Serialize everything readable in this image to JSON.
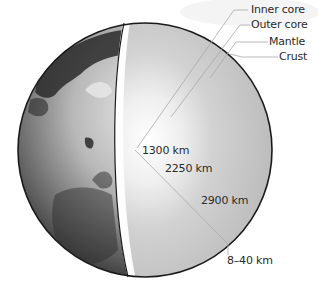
{
  "diagram": {
    "layers": [
      {
        "label": "Inner core"
      },
      {
        "label": "Outer core"
      },
      {
        "label": "Mantle"
      },
      {
        "label": "Crust"
      }
    ],
    "depths": [
      {
        "label": "1300 km"
      },
      {
        "label": "2250 km"
      },
      {
        "label": "2900 km"
      },
      {
        "label": "8–40 km"
      }
    ],
    "colors": {
      "background": "#ffffff",
      "outline": "#1a1a1a",
      "leader_line": "#a8a8a8",
      "text": "#2a2a2a"
    }
  }
}
